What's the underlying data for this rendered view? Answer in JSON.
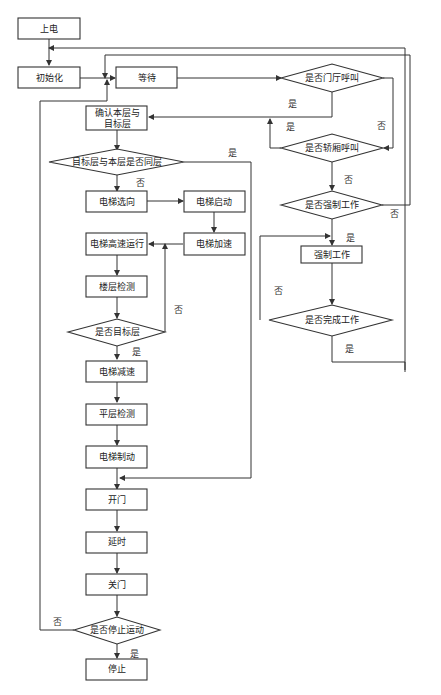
{
  "diagram": {
    "type": "flowchart",
    "nodes": {
      "power_on": "上电",
      "init": "初始化",
      "wait": "等待",
      "hall_call": "是否门厅呼叫",
      "confirm_floor_line1": "确认本层与",
      "confirm_floor_line2": "目标层",
      "car_call": "是否轿厢呼叫",
      "same_floor": "目标层与本层是否同层",
      "forced_check": "是否强制工作",
      "select_dir": "电梯选向",
      "start": "电梯启动",
      "forced_work": "强制工作",
      "high_speed": "电梯高速运行",
      "accelerate": "电梯加速",
      "floor_detect": "楼层检测",
      "forced_done": "是否完成工作",
      "is_target": "是否目标层",
      "decelerate": "电梯减速",
      "level_detect": "平层检测",
      "brake": "电梯制动",
      "open_door": "开门",
      "delay": "延时",
      "close_door": "关门",
      "stop_check": "是否停止运动",
      "stop": "停止"
    },
    "edge_labels": {
      "hall_yes": "是",
      "hall_no": "否",
      "car_yes": "是",
      "car_no": "否",
      "same_yes": "是",
      "same_no": "否",
      "forced_yes": "是",
      "forced_no": "否",
      "done_no": "否",
      "done_yes": "是",
      "target_no": "否",
      "target_yes": "是",
      "stop_no": "否",
      "stop_yes": "是"
    }
  }
}
